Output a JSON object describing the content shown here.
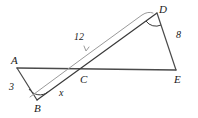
{
  "figure": {
    "kind": "geometry-diagram",
    "background_color": "#ffffff",
    "stroke_color": "#3a3a3a",
    "measure_stroke_color": "#8c8c8c",
    "width": 198,
    "height": 118
  },
  "vertices": [
    {
      "id": "A",
      "label": "A",
      "x": 17,
      "y": 68
    },
    {
      "id": "B",
      "label": "B",
      "x": 37,
      "y": 100
    },
    {
      "id": "C",
      "label": "C",
      "x": 85,
      "y": 69
    },
    {
      "id": "D",
      "label": "D",
      "x": 157,
      "y": 13
    },
    {
      "id": "E",
      "label": "E",
      "x": 176,
      "y": 70
    }
  ],
  "segments": [
    {
      "id": "AE",
      "from": "A",
      "to": "E",
      "style": "solid"
    },
    {
      "id": "AB",
      "from": "A",
      "to": "B",
      "style": "solid"
    },
    {
      "id": "BD",
      "from": "B",
      "to": "D",
      "style": "solid"
    },
    {
      "id": "DE",
      "from": "D",
      "to": "E",
      "style": "solid"
    }
  ],
  "angle_marks": [
    {
      "id": "angle-B",
      "at": "B",
      "label": ""
    },
    {
      "id": "angle-D",
      "at": "D",
      "label": ""
    }
  ],
  "measure_bracket": {
    "id": "bracket-BD",
    "label": "12",
    "spans": "B to D",
    "style": "thin-gray-parallel-line-with-tick"
  },
  "labels": {
    "side_AB": "3",
    "side_BC": "x",
    "side_BD_measure": "12",
    "side_DE": "8"
  }
}
